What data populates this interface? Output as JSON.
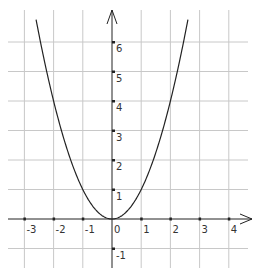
{
  "chart_data": {
    "type": "line",
    "title": "",
    "function": "y = x^2",
    "xlabel": "",
    "ylabel": "",
    "xlim": [
      -3.3,
      4.5
    ],
    "ylim": [
      -1.6,
      7.1
    ],
    "grid": true,
    "x_ticks": [
      -3,
      -2,
      -1,
      0,
      1,
      2,
      3,
      4
    ],
    "y_ticks": [
      -1,
      1,
      2,
      3,
      4,
      5,
      6
    ],
    "x_tick_labels": [
      "-3",
      "-2",
      "-1",
      "0",
      "1",
      "2",
      "3",
      "4"
    ],
    "y_tick_labels": [
      "-1",
      "1",
      "2",
      "3",
      "4",
      "5",
      "6"
    ],
    "series": [
      {
        "name": "parabola",
        "x": [
          -2.6,
          -2,
          -1.5,
          -1,
          -0.5,
          0,
          0.5,
          1,
          1.5,
          2,
          2.6
        ],
        "y": [
          6.76,
          4,
          2.25,
          1,
          0.25,
          0,
          0.25,
          1,
          2.25,
          4,
          6.76
        ]
      }
    ]
  },
  "labels": {
    "x": [
      "-3",
      "-2",
      "-1",
      "0",
      "1",
      "2",
      "3",
      "4"
    ],
    "y": [
      "-1",
      "1",
      "2",
      "3",
      "4",
      "5",
      "6"
    ]
  }
}
